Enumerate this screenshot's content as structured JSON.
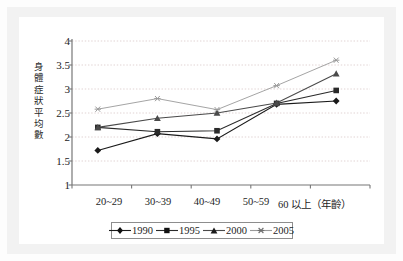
{
  "chart_data": {
    "type": "line",
    "title": "",
    "xlabel": "",
    "ylabel": "身體症狀平均數",
    "x_axis_note": "（年齡）",
    "categories": [
      "20~29",
      "30~39",
      "40~49",
      "50~59",
      "60 以上（年齡）"
    ],
    "category_labels_plain": [
      "20~29",
      "30~39",
      "40~49",
      "50~59",
      "60 以上"
    ],
    "ylim": [
      1,
      4
    ],
    "ytick_labels": [
      "4",
      "3.5",
      "3",
      "2.5",
      "2",
      "1.5",
      "1"
    ],
    "ytick_values": [
      4,
      3.5,
      3,
      2.5,
      2,
      1.5,
      1
    ],
    "grid": true,
    "grid_axis": "y",
    "legend_position": "bottom",
    "series": [
      {
        "name": "1990",
        "marker": "diamond",
        "color": "#1a1a1a",
        "values": [
          1.72,
          2.07,
          1.96,
          2.68,
          2.75
        ]
      },
      {
        "name": "1995",
        "marker": "square",
        "color": "#2a2a2a",
        "values": [
          2.2,
          2.11,
          2.13,
          2.7,
          2.97
        ]
      },
      {
        "name": "2000",
        "marker": "triangle",
        "color": "#4a4a4a",
        "values": [
          2.2,
          2.39,
          2.5,
          2.71,
          3.32
        ]
      },
      {
        "name": "2005",
        "marker": "asterisk",
        "color": "#9a9a9a",
        "values": [
          2.58,
          2.8,
          2.57,
          3.07,
          3.6
        ]
      }
    ]
  },
  "legend": {
    "entries": [
      {
        "label": "1990"
      },
      {
        "label": "1995"
      },
      {
        "label": "2000"
      },
      {
        "label": "2005"
      }
    ]
  },
  "axis": {
    "y_title": "身體症狀平均數",
    "y_ticks": [
      "4",
      "3.5",
      "3",
      "2.5",
      "2",
      "1.5",
      "1"
    ],
    "x_ticks": [
      "20~29",
      "30~39",
      "40~49",
      "50~59",
      "60 以上（年齡）"
    ]
  },
  "colors": {
    "frame": "#f2f2f2",
    "plot_background": "#ffffff",
    "grid": "#d9c8c8",
    "axis": "#777777",
    "text": "#1d1d1d"
  }
}
